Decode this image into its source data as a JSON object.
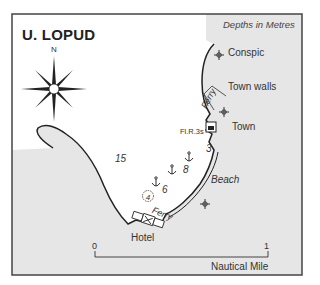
{
  "map": {
    "title": "U. LOPUD",
    "depth_note": "Depths in Metres",
    "compass": {
      "north_label": "N"
    },
    "labels": {
      "conspic": "Conspic",
      "town_walls": "Town walls",
      "town": "Town",
      "light": "Fl.R.3s",
      "ferry_top": "Ferry",
      "ferry_bottom": "Ferry",
      "beach": "Beach",
      "hotel": "Hotel"
    },
    "depths": [
      "15",
      "3",
      "8",
      "6"
    ],
    "marked_depth": "4",
    "scale": {
      "start": "0",
      "end": "1",
      "unit": "Nautical Mile"
    },
    "colors": {
      "land": "#e6e6e6",
      "sea": "#ffffff",
      "coastline": "#222222",
      "border": "#444444"
    },
    "icons": [
      "compass-rose-icon",
      "church-icon",
      "anchorage-icon",
      "light-icon",
      "hotel-icon"
    ]
  }
}
